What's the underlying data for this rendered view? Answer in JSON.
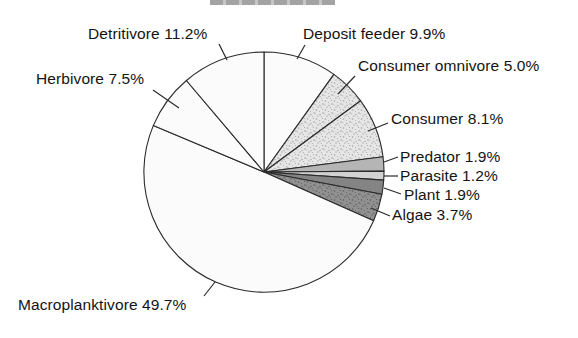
{
  "figure": {
    "background": "#ffffff",
    "cropped_title_bar": true,
    "text_color": "#141414",
    "line_color": "#2b2b2b"
  },
  "chart_data": {
    "type": "pie",
    "title": "",
    "legend_position": "none (direct labels with leader lines)",
    "start_angle": "12 o'clock, clockwise",
    "slices": [
      {
        "label": "Deposit feeder",
        "value": 9.9,
        "text": "Deposit feeder 9.9%",
        "fill": "plain"
      },
      {
        "label": "Consumer omnivore",
        "value": 5.0,
        "text": "Consumer omnivore 5.0%",
        "fill": "stipple-light"
      },
      {
        "label": "Consumer",
        "value": 8.1,
        "text": "Consumer 8.1%",
        "fill": "stipple-light"
      },
      {
        "label": "Predator",
        "value": 1.9,
        "text": "Predator 1.9%",
        "fill": "gray-medium"
      },
      {
        "label": "Parasite",
        "value": 1.2,
        "text": "Parasite 1.2%",
        "fill": "gray-light"
      },
      {
        "label": "Plant",
        "value": 1.9,
        "text": "Plant 1.9%",
        "fill": "gray-dark"
      },
      {
        "label": "Algae",
        "value": 3.7,
        "text": "Algae 3.7%",
        "fill": "stipple-dark"
      },
      {
        "label": "Macroplanktivore",
        "value": 49.7,
        "text": "Macroplanktivore 49.7%",
        "fill": "plain"
      },
      {
        "label": "Herbivore",
        "value": 7.5,
        "text": "Herbivore 7.5%",
        "fill": "plain"
      },
      {
        "label": "Detritivore",
        "value": 11.2,
        "text": "Detritivore 11.2%",
        "fill": "plain"
      }
    ],
    "palette": {
      "plain": "#fbfbfb",
      "gray_medium": "#b5b5b5",
      "gray_light": "#d2d2d2",
      "gray_dark": "#848484",
      "stipple_light_bg": "#e6e6e6",
      "stipple_light_dot": "#a3a3a3",
      "stipple_dark_bg": "#919191",
      "stipple_dark_dot": "#5a5a5a",
      "stroke": "#2b2b2b"
    }
  }
}
